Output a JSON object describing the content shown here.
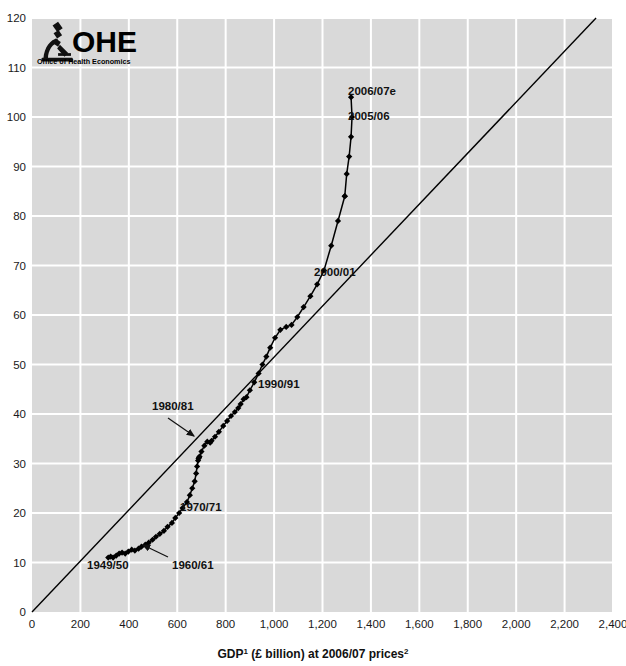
{
  "figure": {
    "background": "#ffffff",
    "plot_background": "#d9d9d9",
    "gridline_color": "#ffffff",
    "marker_color": "#000000",
    "line_color": "#000000",
    "reference_line_color": "#000000",
    "top_cropped_text": "",
    "axis_title": "GDP",
    "axis_title_sup1": "1",
    "axis_title_mid": " (£ billion) at 2006/07 prices",
    "axis_title_sup2": "2"
  },
  "logo": {
    "icon": "microscope-icon",
    "acronym": "OHE",
    "subtitle": "Office of Health Economics"
  },
  "chart_data": {
    "type": "line",
    "title": "",
    "xlabel": "GDP¹ (£ billion) at 2006/07 prices²",
    "ylabel": "",
    "xlim": [
      0,
      2400
    ],
    "ylim": [
      0,
      120
    ],
    "grid": true,
    "legend": "none",
    "xticks": [
      0,
      200,
      400,
      600,
      800,
      1000,
      1200,
      1400,
      1600,
      1800,
      2000,
      2200,
      2400
    ],
    "xticklabels": [
      "0",
      "200",
      "400",
      "600",
      "800",
      "1,000",
      "1,200",
      "1,400",
      "1,600",
      "1,800",
      "2,000",
      "2,200",
      "2,400"
    ],
    "yticks": [
      0,
      10,
      20,
      30,
      40,
      50,
      60,
      70,
      80,
      90,
      100,
      110,
      120
    ],
    "yticklabels": [
      "0",
      "10",
      "20",
      "30",
      "40",
      "50",
      "60",
      "70",
      "80",
      "90",
      "100",
      "110",
      "120"
    ],
    "reference_line": {
      "name": "diagonal-reference-line",
      "from": [
        0,
        0
      ],
      "to": [
        2330,
        120
      ]
    },
    "series": [
      {
        "name": "NHS expenditure vs GDP",
        "x": [
          315,
          325,
          335,
          348,
          360,
          372,
          385,
          398,
          412,
          425,
          440,
          452,
          468,
          482,
          498,
          512,
          528,
          545,
          560,
          578,
          592,
          608,
          622,
          640,
          652,
          662,
          672,
          678,
          682,
          686,
          690,
          688,
          692,
          700,
          712,
          724,
          736,
          742,
          756,
          772,
          790,
          806,
          822,
          838,
          852,
          862,
          874,
          886,
          900,
          918,
          936,
          952,
          968,
          984,
          1004,
          1026,
          1050,
          1072,
          1096,
          1122,
          1150,
          1178,
          1206,
          1236,
          1264,
          1292
        ],
        "y": [
          11.0,
          11.2,
          11.0,
          11.4,
          11.8,
          12.0,
          11.8,
          12.2,
          12.6,
          12.4,
          12.8,
          13.2,
          13.6,
          14.0,
          14.6,
          15.2,
          15.8,
          16.4,
          17.2,
          18.0,
          19.0,
          20.0,
          21.0,
          22.2,
          23.6,
          25.0,
          26.4,
          28.0,
          29.4,
          30.6,
          31.2,
          31.0,
          31.4,
          32.4,
          33.6,
          34.4,
          34.2,
          34.6,
          35.4,
          36.4,
          37.6,
          38.6,
          39.6,
          40.4,
          41.2,
          42.0,
          43.0,
          43.4,
          44.8,
          46.4,
          48.2,
          50.0,
          51.6,
          53.4,
          55.4,
          57.0,
          57.6,
          58.0,
          59.6,
          61.6,
          63.8,
          66.2,
          69.0,
          74.0,
          79.0,
          84.0
        ]
      },
      {
        "name": "NHS expenditure vs GDP (upper branch)",
        "x": [
          1292,
          1300,
          1310,
          1318,
          1322,
          1318
        ],
        "y": [
          84.0,
          88.5,
          92.0,
          96.0,
          100.0,
          104.0
        ]
      }
    ],
    "annotations": [
      {
        "label": "2006/07e",
        "x_px": 348,
        "y_px": 95,
        "kind": "text-right",
        "point_px": [
          341,
          95
        ]
      },
      {
        "label": "2005/06",
        "x_px": 348,
        "y_px": 120,
        "kind": "text-right",
        "point_px": [
          338,
          114
        ]
      },
      {
        "label": "2000/01",
        "x_px": 314,
        "y_px": 276,
        "kind": "text-right",
        "point_px": [
          307,
          272
        ]
      },
      {
        "label": "1990/91",
        "x_px": 258,
        "y_px": 388,
        "kind": "text-right",
        "point_px": [
          250,
          380
        ]
      },
      {
        "label": "1980/81",
        "x_px": 152,
        "y_px": 410,
        "kind": "text-arrow",
        "arrow_from": [
          168,
          418
        ],
        "arrow_to": [
          194,
          436
        ]
      },
      {
        "label": "1970/71",
        "x_px": 180,
        "y_px": 511,
        "kind": "text-right",
        "point_px": [
          172,
          505
        ]
      },
      {
        "label": "1949/50",
        "x_px": 87,
        "y_px": 569,
        "kind": "text-left",
        "point_px": [
          112,
          556
        ]
      },
      {
        "label": "1960/61",
        "x_px": 172,
        "y_px": 569,
        "kind": "text-arrow",
        "arrow_from": [
          168,
          557
        ],
        "arrow_to": [
          143,
          545
        ]
      }
    ]
  }
}
